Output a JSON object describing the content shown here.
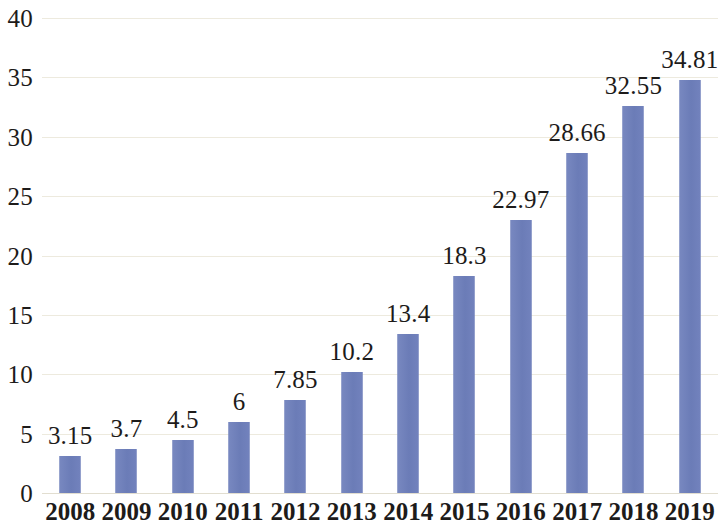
{
  "chart_data": {
    "type": "bar",
    "title": "",
    "subtitle": "",
    "xlabel": "",
    "ylabel": "",
    "categories": [
      "2008",
      "2009",
      "2010",
      "2011",
      "2012",
      "2013",
      "2014",
      "2015",
      "2016",
      "2017",
      "2018",
      "2019"
    ],
    "values": [
      3.15,
      3.7,
      4.5,
      6,
      7.85,
      10.2,
      13.4,
      18.3,
      22.97,
      28.66,
      32.55,
      34.81
    ],
    "data_labels": [
      "3.15",
      "3.7",
      "4.5",
      "6",
      "7.85",
      "10.2",
      "13.4",
      "18.3",
      "22.97",
      "28.66",
      "32.55",
      "34.81"
    ],
    "ylim": [
      0,
      40
    ],
    "ytick_values": [
      0,
      5,
      10,
      15,
      20,
      25,
      30,
      35,
      40
    ],
    "ytick_labels": [
      "0",
      "5",
      "10",
      "15",
      "20",
      "25",
      "30",
      "35",
      "40"
    ],
    "grid": true,
    "grid_axis": "y",
    "legend": null,
    "legend_position": "none",
    "series": [
      {
        "name": "",
        "values": [
          3.15,
          3.7,
          4.5,
          6,
          7.85,
          10.2,
          13.4,
          18.3,
          22.97,
          28.66,
          32.55,
          34.81
        ]
      }
    ]
  },
  "colors": {
    "bar": "#6f80ba",
    "gridline": "#edeade",
    "baseline": "#e2ded0",
    "text": "#1d1b1a",
    "background": "#ffffff"
  }
}
